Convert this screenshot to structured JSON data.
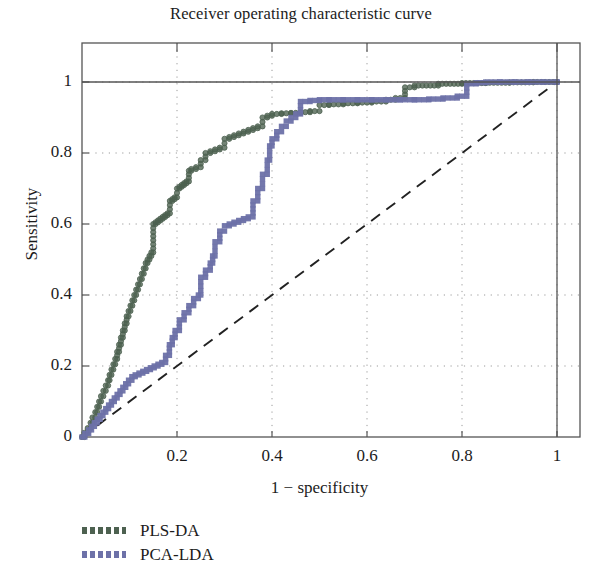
{
  "chart_data": {
    "type": "line",
    "title": "Receiver operating characteristic curve",
    "xlabel": "1 − specificity",
    "ylabel": "Sensitivity",
    "xlim": [
      0,
      1.052
    ],
    "ylim": [
      0,
      1.055
    ],
    "xticks": [
      "0",
      "0.2",
      "0.4",
      "0.6",
      "0.8",
      "1"
    ],
    "xtick_values": [
      0,
      0.2,
      0.4,
      0.6,
      0.8,
      1
    ],
    "yticks": [
      "0",
      "0.2",
      "0.4",
      "0.6",
      "0.8",
      "1"
    ],
    "ytick_values": [
      0,
      0.2,
      0.4,
      0.6,
      0.8,
      1
    ],
    "grid": "dotted",
    "legend_position": "below-left",
    "reference_line": {
      "name": "chance diagonal",
      "style": "dashed",
      "color": "#222222",
      "x": [
        0,
        1
      ],
      "y": [
        0,
        1
      ]
    },
    "series": [
      {
        "name": "PLS-DA",
        "color": "#4d6150",
        "marker": "circle",
        "x": [
          0,
          0.005,
          0.012,
          0.018,
          0.022,
          0.028,
          0.032,
          0.036,
          0.04,
          0.045,
          0.05,
          0.055,
          0.058,
          0.062,
          0.066,
          0.07,
          0.074,
          0.078,
          0.082,
          0.086,
          0.09,
          0.094,
          0.098,
          0.102,
          0.106,
          0.11,
          0.114,
          0.118,
          0.122,
          0.126,
          0.13,
          0.134,
          0.138,
          0.142,
          0.146,
          0.15,
          0.155,
          0.16,
          0.165,
          0.17,
          0.175,
          0.18,
          0.185,
          0.19,
          0.195,
          0.2,
          0.205,
          0.21,
          0.215,
          0.22,
          0.225,
          0.23,
          0.24,
          0.25,
          0.26,
          0.27,
          0.28,
          0.29,
          0.3,
          0.31,
          0.32,
          0.33,
          0.34,
          0.35,
          0.36,
          0.37,
          0.38,
          0.39,
          0.4,
          0.42,
          0.44,
          0.46,
          0.48,
          0.5,
          0.52,
          0.55,
          0.58,
          0.61,
          0.64,
          0.66,
          0.68,
          0.7,
          0.75,
          0.8,
          0.85,
          0.9,
          0.95,
          1.0
        ],
        "y": [
          0,
          0.012,
          0.025,
          0.04,
          0.055,
          0.07,
          0.085,
          0.1,
          0.115,
          0.13,
          0.145,
          0.16,
          0.175,
          0.19,
          0.205,
          0.22,
          0.24,
          0.26,
          0.28,
          0.3,
          0.32,
          0.34,
          0.355,
          0.37,
          0.385,
          0.4,
          0.415,
          0.43,
          0.445,
          0.46,
          0.475,
          0.49,
          0.5,
          0.51,
          0.52,
          0.6,
          0.605,
          0.61,
          0.615,
          0.62,
          0.625,
          0.63,
          0.665,
          0.67,
          0.675,
          0.7,
          0.705,
          0.71,
          0.715,
          0.72,
          0.75,
          0.755,
          0.76,
          0.78,
          0.8,
          0.805,
          0.81,
          0.815,
          0.84,
          0.845,
          0.85,
          0.855,
          0.86,
          0.865,
          0.87,
          0.875,
          0.9,
          0.905,
          0.91,
          0.912,
          0.913,
          0.915,
          0.918,
          0.935,
          0.937,
          0.94,
          0.942,
          0.945,
          0.95,
          0.955,
          0.985,
          0.99,
          0.995,
          0.997,
          0.998,
          0.999,
          1.0,
          1.0
        ],
        "auc_visual_note": "curve rises steeply and plateaus near 0.93 before reaching 1"
      },
      {
        "name": "PCA-LDA",
        "color": "#6d71a8",
        "marker": "square",
        "x": [
          0,
          0.006,
          0.014,
          0.02,
          0.026,
          0.032,
          0.038,
          0.044,
          0.05,
          0.056,
          0.062,
          0.068,
          0.074,
          0.08,
          0.086,
          0.092,
          0.098,
          0.105,
          0.112,
          0.12,
          0.128,
          0.136,
          0.144,
          0.152,
          0.16,
          0.168,
          0.176,
          0.184,
          0.19,
          0.196,
          0.205,
          0.215,
          0.225,
          0.235,
          0.245,
          0.25,
          0.26,
          0.27,
          0.275,
          0.28,
          0.29,
          0.3,
          0.31,
          0.32,
          0.33,
          0.34,
          0.35,
          0.36,
          0.37,
          0.38,
          0.39,
          0.395,
          0.4,
          0.41,
          0.42,
          0.43,
          0.44,
          0.45,
          0.46,
          0.48,
          0.5,
          0.52,
          0.55,
          0.58,
          0.61,
          0.64,
          0.67,
          0.7,
          0.73,
          0.76,
          0.79,
          0.81,
          0.83,
          0.85,
          0.88,
          0.91,
          0.94,
          0.97,
          1.0
        ],
        "y": [
          0,
          0.01,
          0.02,
          0.03,
          0.04,
          0.05,
          0.06,
          0.07,
          0.08,
          0.09,
          0.1,
          0.11,
          0.12,
          0.13,
          0.14,
          0.15,
          0.16,
          0.17,
          0.175,
          0.18,
          0.185,
          0.19,
          0.195,
          0.2,
          0.205,
          0.21,
          0.23,
          0.26,
          0.28,
          0.3,
          0.33,
          0.35,
          0.37,
          0.39,
          0.4,
          0.45,
          0.47,
          0.49,
          0.51,
          0.55,
          0.58,
          0.595,
          0.6,
          0.605,
          0.61,
          0.615,
          0.62,
          0.665,
          0.7,
          0.74,
          0.78,
          0.82,
          0.84,
          0.86,
          0.875,
          0.89,
          0.9,
          0.91,
          0.945,
          0.948,
          0.95,
          0.95,
          0.95,
          0.95,
          0.95,
          0.95,
          0.95,
          0.95,
          0.952,
          0.955,
          0.96,
          0.995,
          0.998,
          1.0,
          1.0,
          1.0,
          1.0,
          1.0,
          1.0
        ],
        "auc_visual_note": "curve lies below PLS-DA, plateaus near 0.95 before reaching 1"
      }
    ]
  },
  "legend": {
    "items": [
      {
        "label": "PLS-DA",
        "color": "#4d6150"
      },
      {
        "label": "PCA-LDA",
        "color": "#6d71a8"
      }
    ]
  },
  "colors": {
    "pls_da": "#4d6150",
    "pca_lda": "#6d71a8",
    "axis": "#555555",
    "grid": "#9a9a9a",
    "diagonal": "#222222",
    "background": "#ffffff"
  }
}
